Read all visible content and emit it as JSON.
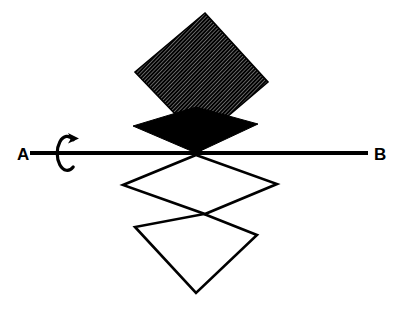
{
  "figure": {
    "background_color": "#ffffff",
    "ink_color": "#000000",
    "width": 393,
    "height": 314,
    "axis": {
      "name": "axis-line",
      "start_label": "A",
      "end_label": "B",
      "x1": 30,
      "y1": 153,
      "x2": 368,
      "y2": 153,
      "thickness": 4,
      "center_x": 196,
      "center_y": 153
    },
    "rotation_arrow": {
      "name": "rotation-arrow",
      "description": "curved arrow around axis indicating rotation",
      "center_x": 67,
      "center_y": 153,
      "radius_x": 10,
      "radius_y": 17
    },
    "shapes": [
      {
        "name": "upper-hatched-square",
        "style": "hatched",
        "fill": "#000000",
        "points": "205,13 268,82 200,140 135,72",
        "hatch_spacing": 2.6,
        "hatch_angle": 42
      },
      {
        "name": "upper-dark-flat-diamond",
        "style": "solid",
        "fill": "#000000",
        "points": "196,153 133,126 196,107 258,124"
      },
      {
        "name": "lower-outlined-flat-diamond",
        "style": "outline",
        "fill": "none",
        "stroke_width": 2.6,
        "points": "196,155 277,184 205,214 123,185"
      },
      {
        "name": "lower-outlined-square",
        "style": "outline",
        "fill": "none",
        "stroke_width": 2.6,
        "points": "204,214 257,235 196,293 135,227"
      }
    ],
    "labels": [
      {
        "name": "label-a",
        "text": "A",
        "x": 17,
        "y": 160
      },
      {
        "name": "label-b",
        "text": "B",
        "x": 374,
        "y": 160
      }
    ]
  }
}
